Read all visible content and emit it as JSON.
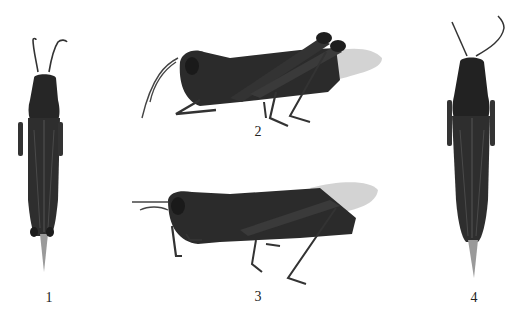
{
  "figure": {
    "background": "#ffffff",
    "specimen_color": "#2b2b2b",
    "wing_color": "#b8b8b8",
    "panels": [
      {
        "id": 1,
        "label": "1",
        "view": "dorsal"
      },
      {
        "id": 2,
        "label": "2",
        "view": "lateral"
      },
      {
        "id": 3,
        "label": "3",
        "view": "lateral"
      },
      {
        "id": 4,
        "label": "4",
        "view": "dorsal"
      }
    ]
  }
}
